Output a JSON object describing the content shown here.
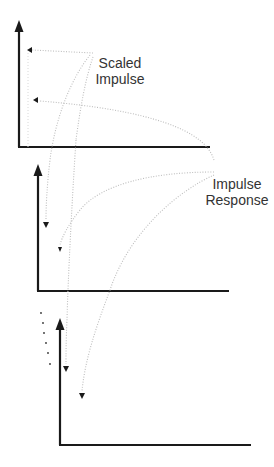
{
  "labels": {
    "scaled_impulse": {
      "line1": "Scaled",
      "line2": "Impulse"
    },
    "impulse_response": {
      "line1": "Impulse",
      "line2": "Response"
    }
  },
  "colors": {
    "axis": "#1a1a1a",
    "dotted": "#bdbdbd",
    "text": "#333333",
    "background": "#ffffff"
  },
  "plots": [
    {
      "name": "plot-top",
      "axis_x": 19,
      "axis_top": 22,
      "axis_bottom": 147,
      "x_end": 210
    },
    {
      "name": "plot-middle",
      "axis_x": 38,
      "axis_top": 166,
      "axis_bottom": 291,
      "x_end": 229
    },
    {
      "name": "plot-bottom",
      "axis_x": 60,
      "axis_top": 320,
      "axis_bottom": 445,
      "x_end": 251
    }
  ],
  "ellipsis_dots": [
    [
      41,
      313
    ],
    [
      43,
      323
    ],
    [
      44,
      333
    ],
    [
      46,
      343
    ],
    [
      48,
      353
    ],
    [
      50,
      364
    ]
  ]
}
